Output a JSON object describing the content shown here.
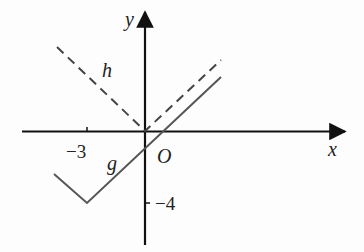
{
  "diagram": {
    "type": "function-graph",
    "axes": {
      "x_label": "x",
      "y_label": "y",
      "origin_label": "O",
      "ticks": [
        {
          "axis": "x",
          "value": -3,
          "label": "−3"
        },
        {
          "axis": "y",
          "value": -4,
          "label": "−4"
        }
      ]
    },
    "functions": [
      {
        "name": "h",
        "label": "h",
        "style": "dashed",
        "description": "V-shape with vertex at origin",
        "vertex": [
          0,
          0
        ]
      },
      {
        "name": "g",
        "label": "g",
        "style": "solid",
        "description": "V-shape with vertex at (-3,-4)",
        "vertex": [
          -3,
          -4
        ]
      }
    ],
    "colors": {
      "axis": "#111111",
      "h": "#444444",
      "g": "#555555"
    }
  }
}
